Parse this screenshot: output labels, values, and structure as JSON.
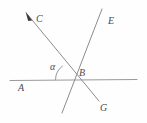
{
  "figure": {
    "type": "geometry-diagram",
    "background_color": "#fefefe",
    "stroke_color": "#8c8c8c",
    "label_color": "#4a4a4a",
    "stroke_width": 1,
    "points": {
      "intersection": {
        "name": "B",
        "x": 73,
        "y": 80
      }
    },
    "lines": [
      {
        "name": "horizontal-line",
        "id": "line-A",
        "x1": 10,
        "y1": 80,
        "x2": 137,
        "y2": 79
      },
      {
        "name": "ray-CG",
        "id": "line-CG",
        "x1": 27,
        "y1": 14,
        "x2": 99,
        "y2": 101,
        "arrow_at": "start"
      },
      {
        "name": "line-E",
        "id": "line-E",
        "x1": 102,
        "y1": 9,
        "x2": 62,
        "y2": 113
      }
    ],
    "angle_arc": {
      "name": "alpha-arc",
      "center_x": 73,
      "center_y": 80,
      "radius": 18,
      "start_angle_deg": 180,
      "end_angle_deg": 230
    },
    "labels": {
      "C": "C",
      "E": "E",
      "B": "B",
      "A": "A",
      "G": "G",
      "alpha": "α"
    }
  }
}
